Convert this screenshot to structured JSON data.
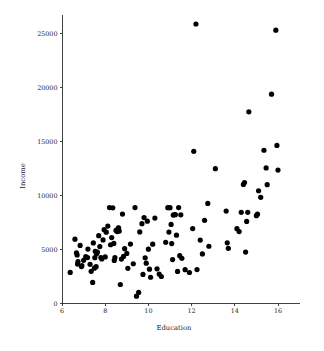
{
  "chart_data": {
    "type": "scatter",
    "title": "",
    "xlabel": "Education",
    "ylabel": "Income",
    "xlim": [
      6,
      17
    ],
    "ylim": [
      0,
      26500
    ],
    "grid": false,
    "legend": null,
    "xticks": [
      6,
      8,
      10,
      12,
      14,
      16
    ],
    "xtick_labels": [
      "6",
      "8",
      "10",
      "12",
      "14",
      "16"
    ],
    "yticks": [
      0,
      5000,
      10000,
      15000,
      20000,
      25000
    ],
    "ytick_labels": [
      "0",
      "5000",
      "10000",
      "15000",
      "20000",
      "25000"
    ],
    "marker": "filled-circle",
    "marker_color": "#000000",
    "marker_size": 2.6,
    "points": [
      [
        6.38,
        2880
      ],
      [
        6.6,
        5960
      ],
      [
        6.67,
        4700
      ],
      [
        6.7,
        4500
      ],
      [
        6.72,
        3650
      ],
      [
        6.74,
        3880
      ],
      [
        6.84,
        5380
      ],
      [
        6.9,
        3420
      ],
      [
        6.92,
        3500
      ],
      [
        7.0,
        4000
      ],
      [
        7.1,
        4350
      ],
      [
        7.18,
        4250
      ],
      [
        7.2,
        5040
      ],
      [
        7.3,
        3630
      ],
      [
        7.35,
        2980
      ],
      [
        7.42,
        1950
      ],
      [
        7.45,
        5610
      ],
      [
        7.5,
        3270
      ],
      [
        7.52,
        4240
      ],
      [
        7.54,
        4830
      ],
      [
        7.58,
        3410
      ],
      [
        7.6,
        4600
      ],
      [
        7.64,
        4750
      ],
      [
        7.7,
        6280
      ],
      [
        7.75,
        5270
      ],
      [
        7.8,
        4260
      ],
      [
        7.84,
        4120
      ],
      [
        7.9,
        5890
      ],
      [
        7.95,
        6840
      ],
      [
        8.0,
        4310
      ],
      [
        8.05,
        6600
      ],
      [
        8.12,
        7170
      ],
      [
        8.2,
        8880
      ],
      [
        8.25,
        5440
      ],
      [
        8.3,
        6100
      ],
      [
        8.35,
        8860
      ],
      [
        8.4,
        5560
      ],
      [
        8.42,
        3990
      ],
      [
        8.45,
        4260
      ],
      [
        8.5,
        6770
      ],
      [
        8.55,
        6660
      ],
      [
        8.6,
        6990
      ],
      [
        8.62,
        7000
      ],
      [
        8.65,
        6710
      ],
      [
        8.7,
        1760
      ],
      [
        8.75,
        4110
      ],
      [
        8.8,
        8280
      ],
      [
        8.85,
        4360
      ],
      [
        8.9,
        5080
      ],
      [
        9.0,
        4640
      ],
      [
        9.05,
        3260
      ],
      [
        9.17,
        5500
      ],
      [
        9.3,
        3680
      ],
      [
        9.38,
        8880
      ],
      [
        9.45,
        680
      ],
      [
        9.55,
        1030
      ],
      [
        9.6,
        6630
      ],
      [
        9.7,
        7390
      ],
      [
        9.75,
        2690
      ],
      [
        9.8,
        7960
      ],
      [
        9.85,
        4230
      ],
      [
        9.9,
        3730
      ],
      [
        9.95,
        7620
      ],
      [
        10.0,
        5030
      ],
      [
        10.05,
        3180
      ],
      [
        10.1,
        2430
      ],
      [
        10.2,
        5490
      ],
      [
        10.3,
        7910
      ],
      [
        10.4,
        3210
      ],
      [
        10.5,
        2720
      ],
      [
        10.6,
        2500
      ],
      [
        10.8,
        5660
      ],
      [
        10.9,
        8870
      ],
      [
        10.95,
        6610
      ],
      [
        11.0,
        8870
      ],
      [
        11.05,
        7320
      ],
      [
        11.08,
        5550
      ],
      [
        11.12,
        4070
      ],
      [
        11.15,
        8190
      ],
      [
        11.2,
        8230
      ],
      [
        11.25,
        8220
      ],
      [
        11.3,
        6330
      ],
      [
        11.35,
        2970
      ],
      [
        11.4,
        8880
      ],
      [
        11.45,
        4430
      ],
      [
        11.5,
        8210
      ],
      [
        11.55,
        4190
      ],
      [
        11.7,
        3130
      ],
      [
        11.9,
        2870
      ],
      [
        12.05,
        6940
      ],
      [
        12.1,
        14090
      ],
      [
        12.2,
        25879
      ],
      [
        12.25,
        3140
      ],
      [
        12.4,
        5870
      ],
      [
        12.5,
        4590
      ],
      [
        12.6,
        7700
      ],
      [
        12.75,
        9270
      ],
      [
        12.8,
        5300
      ],
      [
        13.1,
        12480
      ],
      [
        13.6,
        8560
      ],
      [
        13.65,
        5620
      ],
      [
        13.7,
        5110
      ],
      [
        14.1,
        6930
      ],
      [
        14.2,
        6660
      ],
      [
        14.3,
        8440
      ],
      [
        14.4,
        11030
      ],
      [
        14.45,
        11200
      ],
      [
        14.5,
        4760
      ],
      [
        14.55,
        7600
      ],
      [
        14.6,
        8440
      ],
      [
        14.65,
        17750
      ],
      [
        15.0,
        8130
      ],
      [
        15.05,
        8270
      ],
      [
        15.1,
        10440
      ],
      [
        15.2,
        9830
      ],
      [
        15.35,
        14190
      ],
      [
        15.45,
        12550
      ],
      [
        15.5,
        11000
      ],
      [
        15.7,
        19380
      ],
      [
        15.9,
        25308
      ],
      [
        15.95,
        14640
      ],
      [
        16.0,
        12350
      ]
    ]
  },
  "axes": {
    "x_title": "Education",
    "y_title": "Income"
  }
}
